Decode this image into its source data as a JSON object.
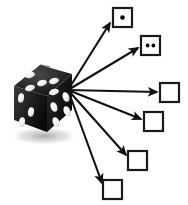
{
  "figure": {
    "title": "Die roll outcome diagram",
    "background_color": "#ffffff",
    "width": 188,
    "height": 205
  },
  "die": {
    "label": "six-sided die",
    "body_color": "#1a1a1a",
    "pip_color": "#f2f2f2",
    "shadow_color": "#c9c9c9",
    "faces": [
      {
        "name": "top",
        "pips": 5
      },
      {
        "name": "left",
        "pips": 3
      },
      {
        "name": "right",
        "pips": 4
      }
    ]
  },
  "outcomes": {
    "count": 6,
    "box_stroke_color": "#1a1a1a",
    "box_fill_color": "#ffffff",
    "pip_color": "#000000",
    "items": [
      {
        "id": "outcome-1",
        "value": "1",
        "pips": 1,
        "x": 113,
        "y": 8,
        "w": 19,
        "h": 19
      },
      {
        "id": "outcome-2",
        "value": "2",
        "pips": 2,
        "x": 141,
        "y": 36,
        "w": 19,
        "h": 19
      },
      {
        "id": "outcome-3",
        "value": "3",
        "pips": 0,
        "x": 160,
        "y": 83,
        "w": 19,
        "h": 19
      },
      {
        "id": "outcome-4",
        "value": "4",
        "pips": 0,
        "x": 144,
        "y": 112,
        "w": 19,
        "h": 19
      },
      {
        "id": "outcome-5",
        "value": "5",
        "pips": 0,
        "x": 128,
        "y": 151,
        "w": 19,
        "h": 19
      },
      {
        "id": "outcome-6",
        "value": "6",
        "pips": 0,
        "x": 103,
        "y": 180,
        "w": 19,
        "h": 19
      }
    ]
  },
  "arrows": {
    "color": "#111111",
    "origin_x": 68,
    "origin_y": 90,
    "items": [
      {
        "id": "arrow-to-1",
        "to_x": 110,
        "to_y": 23
      },
      {
        "id": "arrow-to-2",
        "to_x": 138,
        "to_y": 48
      },
      {
        "id": "arrow-to-3",
        "to_x": 157,
        "to_y": 92
      },
      {
        "id": "arrow-to-4",
        "to_x": 141,
        "to_y": 119
      },
      {
        "id": "arrow-to-5",
        "to_x": 126,
        "to_y": 155
      },
      {
        "id": "arrow-to-6",
        "to_x": 102,
        "to_y": 183
      }
    ]
  }
}
